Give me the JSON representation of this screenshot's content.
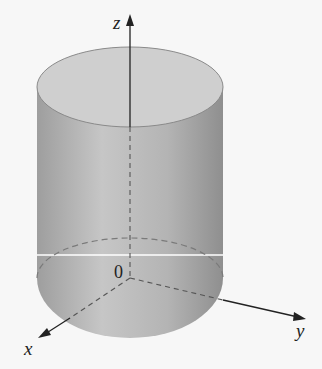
{
  "figure": {
    "axes": {
      "x_label": "x",
      "y_label": "y",
      "z_label": "z",
      "origin_label": "0"
    },
    "colors": {
      "background": "#f7f7f7",
      "cylinder_side_light": "#c4c4c4",
      "cylinder_side_dark": "#9c9c9c",
      "top_face": "#cfcfcf",
      "axis": "#222222",
      "hidden_line": "#7a7a7a",
      "cut_line": "#ffffff"
    }
  }
}
